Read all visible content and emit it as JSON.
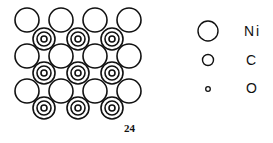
{
  "diagram": {
    "lattice": {
      "ni_rows_y": [
        20,
        56,
        91
      ],
      "ni_cols_x": [
        27,
        61,
        95,
        129
      ],
      "ni_radius": 12,
      "co_rows_y": [
        39,
        73,
        108
      ],
      "co_cols_x": [
        44,
        78,
        112
      ],
      "co_outer_radius": 11,
      "co_mid_radius": 7,
      "co_inner_radius": 3
    },
    "legend": [
      {
        "symbol": "large-circle",
        "label": "Ni"
      },
      {
        "symbol": "medium-circle",
        "label": "C"
      },
      {
        "symbol": "small-circle",
        "label": "O"
      }
    ],
    "page_number": "24",
    "stroke_color": "#111111"
  }
}
